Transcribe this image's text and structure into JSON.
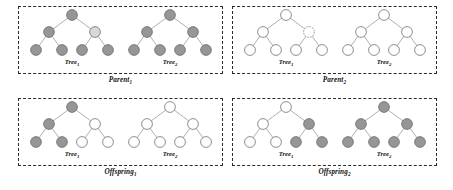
{
  "figure": {
    "width": 453,
    "height": 190,
    "background_color": "#ffffff"
  },
  "colors": {
    "node_gray": "#969696",
    "node_light_gray": "#d8d8d8",
    "node_white": "#ffffff",
    "node_stroke": "#5e5e5e",
    "edge": "#8c8c8c",
    "panel_border": "#2a2a2a",
    "text": "#111111"
  },
  "node_fill_legend": {
    "gray": "Node originating from Parent 1 genetic material",
    "white": "Node originating from Parent 2 genetic material",
    "light_gray": "Selected crossover point in Parent 1",
    "dashed": "Selected crossover point in Parent 2"
  },
  "tree_structure": {
    "node_count": 7,
    "description": "Complete binary tree of depth 2: root, two internal children, four leaves",
    "nodes": [
      "root",
      "left",
      "right",
      "left-left",
      "left-right",
      "right-left",
      "right-right"
    ],
    "edges": [
      [
        "root",
        "left"
      ],
      [
        "root",
        "right"
      ],
      [
        "left",
        "left-left"
      ],
      [
        "left",
        "left-right"
      ],
      [
        "right",
        "right-left"
      ],
      [
        "right",
        "right-right"
      ]
    ]
  },
  "panels": [
    {
      "id": "parent-1",
      "caption": "Parent",
      "caption_sub": "1",
      "trees": [
        {
          "id": "parent-1-tree-1",
          "label": "Tree",
          "label_sub": "1",
          "nodes": {
            "root": {
              "fill": "gray",
              "outline": "solid"
            },
            "left": {
              "fill": "gray",
              "outline": "solid"
            },
            "right": {
              "fill": "light_gray",
              "outline": "solid"
            },
            "left-left": {
              "fill": "gray",
              "outline": "solid"
            },
            "left-right": {
              "fill": "gray",
              "outline": "solid"
            },
            "right-left": {
              "fill": "gray",
              "outline": "solid"
            },
            "right-right": {
              "fill": "gray",
              "outline": "solid"
            }
          }
        },
        {
          "id": "parent-1-tree-2",
          "label": "Tree",
          "label_sub": "2",
          "nodes": {
            "root": {
              "fill": "gray",
              "outline": "solid"
            },
            "left": {
              "fill": "gray",
              "outline": "solid"
            },
            "right": {
              "fill": "gray",
              "outline": "solid"
            },
            "left-left": {
              "fill": "gray",
              "outline": "solid"
            },
            "left-right": {
              "fill": "gray",
              "outline": "solid"
            },
            "right-left": {
              "fill": "gray",
              "outline": "solid"
            },
            "right-right": {
              "fill": "gray",
              "outline": "solid"
            }
          }
        }
      ]
    },
    {
      "id": "parent-2",
      "caption": "Parent",
      "caption_sub": "2",
      "trees": [
        {
          "id": "parent-2-tree-1",
          "label": "Tree",
          "label_sub": "1",
          "nodes": {
            "root": {
              "fill": "white",
              "outline": "solid"
            },
            "left": {
              "fill": "white",
              "outline": "solid"
            },
            "right": {
              "fill": "white",
              "outline": "dashed"
            },
            "left-left": {
              "fill": "white",
              "outline": "solid"
            },
            "left-right": {
              "fill": "white",
              "outline": "solid"
            },
            "right-left": {
              "fill": "white",
              "outline": "solid"
            },
            "right-right": {
              "fill": "white",
              "outline": "solid"
            }
          }
        },
        {
          "id": "parent-2-tree-2",
          "label": "Tree",
          "label_sub": "2",
          "nodes": {
            "root": {
              "fill": "white",
              "outline": "solid"
            },
            "left": {
              "fill": "white",
              "outline": "solid"
            },
            "right": {
              "fill": "white",
              "outline": "solid"
            },
            "left-left": {
              "fill": "white",
              "outline": "solid"
            },
            "left-right": {
              "fill": "white",
              "outline": "solid"
            },
            "right-left": {
              "fill": "white",
              "outline": "solid"
            },
            "right-right": {
              "fill": "white",
              "outline": "solid"
            }
          }
        }
      ]
    },
    {
      "id": "offspring-1",
      "caption": "Offspring",
      "caption_sub": "1",
      "trees": [
        {
          "id": "offspring-1-tree-1",
          "label": "Tree",
          "label_sub": "1",
          "nodes": {
            "root": {
              "fill": "gray",
              "outline": "solid"
            },
            "left": {
              "fill": "gray",
              "outline": "solid"
            },
            "right": {
              "fill": "white",
              "outline": "solid"
            },
            "left-left": {
              "fill": "gray",
              "outline": "solid"
            },
            "left-right": {
              "fill": "gray",
              "outline": "solid"
            },
            "right-left": {
              "fill": "white",
              "outline": "solid"
            },
            "right-right": {
              "fill": "white",
              "outline": "solid"
            }
          }
        },
        {
          "id": "offspring-1-tree-2",
          "label": "Tree",
          "label_sub": "2",
          "nodes": {
            "root": {
              "fill": "white",
              "outline": "solid"
            },
            "left": {
              "fill": "white",
              "outline": "solid"
            },
            "right": {
              "fill": "white",
              "outline": "solid"
            },
            "left-left": {
              "fill": "white",
              "outline": "solid"
            },
            "left-right": {
              "fill": "white",
              "outline": "solid"
            },
            "right-left": {
              "fill": "white",
              "outline": "solid"
            },
            "right-right": {
              "fill": "white",
              "outline": "solid"
            }
          }
        }
      ]
    },
    {
      "id": "offspring-2",
      "caption": "Offspring",
      "caption_sub": "2",
      "trees": [
        {
          "id": "offspring-2-tree-1",
          "label": "Tree",
          "label_sub": "1",
          "nodes": {
            "root": {
              "fill": "white",
              "outline": "solid"
            },
            "left": {
              "fill": "white",
              "outline": "solid"
            },
            "right": {
              "fill": "gray",
              "outline": "solid"
            },
            "left-left": {
              "fill": "white",
              "outline": "solid"
            },
            "left-right": {
              "fill": "white",
              "outline": "solid"
            },
            "right-left": {
              "fill": "gray",
              "outline": "solid"
            },
            "right-right": {
              "fill": "gray",
              "outline": "solid"
            }
          }
        },
        {
          "id": "offspring-2-tree-2",
          "label": "Tree",
          "label_sub": "2",
          "nodes": {
            "root": {
              "fill": "gray",
              "outline": "solid"
            },
            "left": {
              "fill": "gray",
              "outline": "solid"
            },
            "right": {
              "fill": "gray",
              "outline": "solid"
            },
            "left-left": {
              "fill": "gray",
              "outline": "solid"
            },
            "left-right": {
              "fill": "gray",
              "outline": "solid"
            },
            "right-left": {
              "fill": "gray",
              "outline": "solid"
            },
            "right-right": {
              "fill": "gray",
              "outline": "solid"
            }
          }
        }
      ]
    }
  ]
}
